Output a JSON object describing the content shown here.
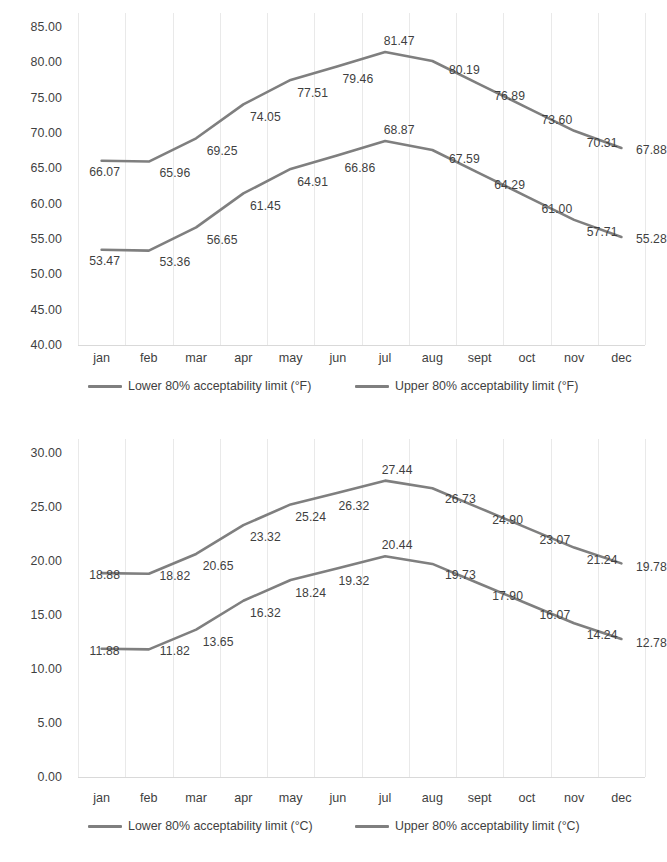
{
  "chart_data": [
    {
      "type": "line",
      "title": "",
      "xlabel": "",
      "ylabel": "",
      "unit": "°F",
      "categories": [
        "jan",
        "feb",
        "mar",
        "apr",
        "may",
        "jun",
        "jul",
        "aug",
        "sept",
        "oct",
        "nov",
        "dec"
      ],
      "ylim": [
        40.0,
        85.0
      ],
      "yticks": [
        "40.00",
        "45.00",
        "50.00",
        "55.00",
        "60.00",
        "65.00",
        "70.00",
        "75.00",
        "80.00",
        "85.00"
      ],
      "ytick_values": [
        40,
        45,
        50,
        55,
        60,
        65,
        70,
        75,
        80,
        85
      ],
      "grid": true,
      "legend_position": "bottom",
      "series": [
        {
          "name": "Lower 80% acceptability limit (°F)",
          "color": "#7f7f7f",
          "values": [
            53.47,
            53.36,
            56.65,
            61.45,
            64.91,
            66.86,
            68.87,
            67.59,
            64.29,
            61.0,
            57.71,
            55.28
          ],
          "labels": [
            "53.47",
            "53.36",
            "56.65",
            "61.45",
            "64.91",
            "66.86",
            "68.87",
            "67.59",
            "64.29",
            "61.00",
            "57.71",
            "55.28"
          ]
        },
        {
          "name": "Upper 80% acceptability limit (°F)",
          "color": "#7f7f7f",
          "values": [
            66.07,
            65.96,
            69.25,
            74.05,
            77.51,
            79.46,
            81.47,
            80.19,
            76.89,
            73.6,
            70.31,
            67.88
          ],
          "labels": [
            "66.07",
            "65.96",
            "69.25",
            "74.05",
            "77.51",
            "79.46",
            "81.47",
            "80.19",
            "76.89",
            "73.60",
            "70.31",
            "67.88"
          ]
        }
      ]
    },
    {
      "type": "line",
      "title": "",
      "xlabel": "",
      "ylabel": "",
      "unit": "°C",
      "categories": [
        "jan",
        "feb",
        "mar",
        "apr",
        "may",
        "jun",
        "jul",
        "aug",
        "sept",
        "oct",
        "nov",
        "dec"
      ],
      "ylim": [
        0.0,
        30.0
      ],
      "yticks": [
        "0.00",
        "5.00",
        "10.00",
        "15.00",
        "20.00",
        "25.00",
        "30.00"
      ],
      "ytick_values": [
        0,
        5,
        10,
        15,
        20,
        25,
        30
      ],
      "grid": true,
      "legend_position": "bottom",
      "series": [
        {
          "name": "Lower 80% acceptability limit (°C)",
          "color": "#7f7f7f",
          "values": [
            11.88,
            11.82,
            13.65,
            16.32,
            18.24,
            19.32,
            20.44,
            19.73,
            17.9,
            16.07,
            14.24,
            12.78
          ],
          "labels": [
            "11.88",
            "11.82",
            "13.65",
            "16.32",
            "18.24",
            "19.32",
            "20.44",
            "19.73",
            "17.90",
            "16.07",
            "14.24",
            "12.78"
          ]
        },
        {
          "name": "Upper 80% acceptability limit (°C)",
          "color": "#7f7f7f",
          "values": [
            18.88,
            18.82,
            20.65,
            23.32,
            25.24,
            26.32,
            27.44,
            26.73,
            24.9,
            23.07,
            21.24,
            19.78
          ],
          "labels": [
            "18.88",
            "18.82",
            "20.65",
            "23.32",
            "25.24",
            "26.32",
            "27.44",
            "26.73",
            "24.90",
            "23.07",
            "21.24",
            "19.78"
          ]
        }
      ]
    }
  ]
}
